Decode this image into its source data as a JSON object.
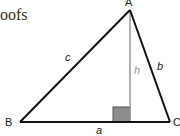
{
  "header_fragment": "oofs",
  "diagram": {
    "vertices": {
      "A": {
        "label": "A",
        "x": 130,
        "y": 10
      },
      "B": {
        "label": "B",
        "x": 20,
        "y": 122
      },
      "C": {
        "label": "C",
        "x": 170,
        "y": 122
      }
    },
    "sides": {
      "a": "a",
      "b": "b",
      "c": "c"
    },
    "altitude_label": "h",
    "colors": {
      "stroke": "#111111",
      "altitude": "#9a9a9a",
      "right_angle_fill": "#8c8c8c"
    }
  }
}
